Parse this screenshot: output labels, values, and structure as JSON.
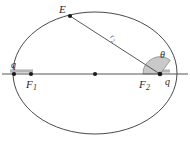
{
  "figure": {
    "type": "geometry-diagram",
    "background_color": "#ffffff",
    "stroke_color": "#4a4a4a",
    "axis_color": "#555555",
    "sector_fill": "#c9c9c9",
    "sector_stroke": "#8a8a8a",
    "point_color": "#1a1a1a",
    "label_color": "#2b2b2b",
    "highlight_band_color": "#b5b5b5",
    "ellipse": {
      "center_x": 95,
      "center_y": 73,
      "radius_x": 82,
      "radius_y": 61
    },
    "labels": {
      "point_e": "E",
      "radius_r2": "r",
      "radius_r2_sub": "2",
      "angle_theta": "θ",
      "charge_left": "q",
      "charge_right": "q",
      "focus_1": "F",
      "focus_1_sub": "1",
      "focus_2": "F",
      "focus_2_sub": "2"
    },
    "points": {
      "point_e": {
        "x": 70,
        "y": 16
      },
      "focus_1": {
        "x": 31,
        "y": 74
      },
      "focus_2": {
        "x": 95,
        "y": 74
      },
      "vertex_right": {
        "x": 160,
        "y": 74
      },
      "vertex_left": {
        "x": 14,
        "y": 74
      }
    },
    "axis_line": {
      "x1": 2,
      "y1": 74,
      "x2": 188,
      "y2": 74
    }
  }
}
